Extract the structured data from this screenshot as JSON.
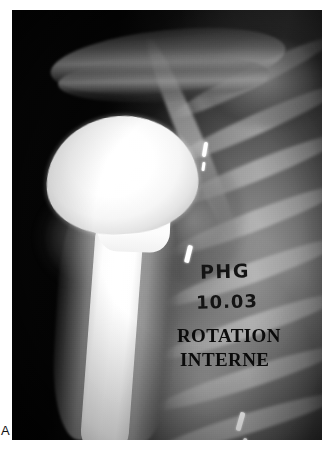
{
  "figure": {
    "panel_label": "A"
  },
  "radiograph": {
    "modality_name": "shoulder-radiograph",
    "view_description": "anteroposterior shoulder",
    "frame": {
      "x": 12,
      "y": 10,
      "width": 310,
      "height": 430
    },
    "background_color": "#050505",
    "bone_color": "#b4b4b4",
    "implant_color": "#ffffff"
  },
  "annotations": {
    "handwritten": {
      "initials": "PHG",
      "date": "10.03"
    },
    "printed": {
      "view_line1": "ROTATION",
      "view_line2": "INTERNE"
    },
    "ink_color": "#161616"
  },
  "anatomy": {
    "implant": {
      "name": "humeral-head-prosthesis",
      "parts": [
        "prosthesis-head",
        "prosthesis-collar",
        "prosthesis-stem"
      ]
    },
    "structures": [
      "acromion",
      "clavicle",
      "scapula-border",
      "glenoid",
      "humeral-shaft",
      "metaphysis",
      "ribs",
      "soft-tissue"
    ]
  },
  "ribs": [
    {
      "left": 150,
      "top": 58,
      "width": 180,
      "rotate": -26
    },
    {
      "left": 150,
      "top": 104,
      "width": 190,
      "rotate": -24
    },
    {
      "left": 152,
      "top": 150,
      "width": 188,
      "rotate": -22
    },
    {
      "left": 150,
      "top": 200,
      "width": 190,
      "rotate": -21
    },
    {
      "left": 146,
      "top": 252,
      "width": 192,
      "rotate": -20
    },
    {
      "left": 142,
      "top": 306,
      "width": 196,
      "rotate": -19
    },
    {
      "left": 138,
      "top": 358,
      "width": 198,
      "rotate": -18
    },
    {
      "left": 134,
      "top": 404,
      "width": 200,
      "rotate": -17
    }
  ],
  "surgical_clips": [
    {
      "name": "clip-upper",
      "left": 191,
      "top": 132,
      "width": 4,
      "height": 15,
      "rotate": 10
    },
    {
      "name": "clip-upper-second",
      "left": 190,
      "top": 152,
      "width": 3,
      "height": 9,
      "rotate": 8
    },
    {
      "name": "clip-middle",
      "left": 174,
      "top": 235,
      "width": 5,
      "height": 18,
      "rotate": 14
    },
    {
      "name": "clip-lower",
      "left": 226,
      "top": 402,
      "width": 5,
      "height": 19,
      "rotate": 16
    },
    {
      "name": "clip-lowest",
      "left": 230,
      "top": 428,
      "width": 4,
      "height": 14,
      "rotate": 14
    }
  ]
}
